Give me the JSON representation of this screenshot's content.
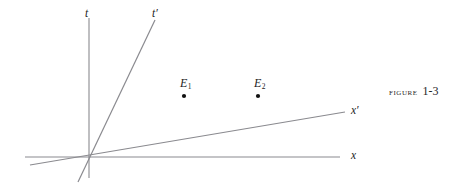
{
  "figure": {
    "caption_word": "Figure",
    "caption_number": "1-3",
    "width": 475,
    "height": 189,
    "background_color": "#ffffff",
    "line_color": "#8a8a8f",
    "text_color": "#1c1c1c",
    "dot_color": "#111111"
  },
  "diagram": {
    "type": "minkowski-spacetime-diagram",
    "origin": {
      "x": 90,
      "y": 156
    },
    "axes": [
      {
        "id": "t",
        "label": "t",
        "label_x": 85,
        "label_y": 8,
        "x1": 89,
        "y1": 18,
        "x2": 89,
        "y2": 178
      },
      {
        "id": "t-prime",
        "label": "t′",
        "label_x": 152,
        "label_y": 8,
        "x1": 155,
        "y1": 20,
        "x2": 78,
        "y2": 182
      },
      {
        "id": "x",
        "label": "x",
        "label_x": 351,
        "label_y": 150,
        "x1": 25,
        "y1": 157,
        "x2": 340,
        "y2": 157
      },
      {
        "id": "x-prime",
        "label": "x′",
        "label_x": 351,
        "label_y": 105,
        "x1": 30,
        "y1": 165,
        "x2": 345,
        "y2": 112
      }
    ],
    "events": [
      {
        "id": "E1",
        "label_base": "E",
        "label_sub": "1",
        "label_x": 180,
        "label_y": 77,
        "dot_x": 184,
        "dot_y": 96
      },
      {
        "id": "E2",
        "label_base": "E",
        "label_sub": "2",
        "label_x": 254,
        "label_y": 77,
        "dot_x": 258,
        "dot_y": 96
      }
    ]
  }
}
